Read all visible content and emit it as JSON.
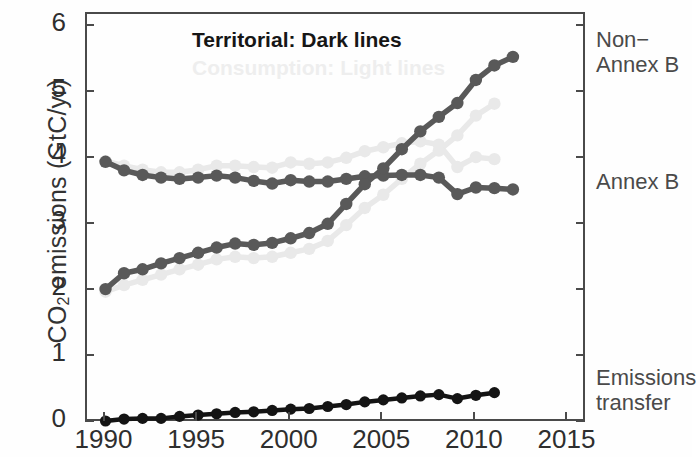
{
  "axes": {
    "ylabel_prefix": "CO",
    "ylabel_sub": "2",
    "ylabel_suffix": " emissions (GtC/yr)",
    "ytick_labels": [
      "6",
      "5",
      "4",
      "3",
      "2",
      "1",
      "0"
    ],
    "xtick_labels": [
      "1990",
      "1995",
      "2000",
      "2005",
      "2010",
      "2015"
    ]
  },
  "legend": {
    "territorial": "Territorial: Dark lines",
    "consumption": "Consumption: Light lines"
  },
  "annotations": {
    "non_annex_b": "Non−\nAnnex B",
    "annex_b": "Annex B",
    "emissions_transfer": "Emissions\ntransfer"
  },
  "colors": {
    "dark_gray": "#595959",
    "light_gray": "#e9e9e9",
    "black": "#141414",
    "frame": "#4a4a4a",
    "legend_light": "#eeeeee"
  },
  "chart_data": {
    "type": "line",
    "title": "",
    "xlabel": "",
    "ylabel": "CO2 emissions (GtC/yr)",
    "xlim": [
      1989,
      2016
    ],
    "ylim": [
      0,
      6.2
    ],
    "xticks": [
      1990,
      1995,
      2000,
      2005,
      2010,
      2015
    ],
    "yticks": [
      0,
      1,
      2,
      3,
      4,
      5,
      6
    ],
    "grid": false,
    "legend_position": "top-left",
    "x": [
      1990,
      1991,
      1992,
      1993,
      1994,
      1995,
      1996,
      1997,
      1998,
      1999,
      2000,
      2001,
      2002,
      2003,
      2004,
      2005,
      2006,
      2007,
      2008,
      2009,
      2010,
      2011,
      2012
    ],
    "series": [
      {
        "name": "Annex B territorial",
        "style": "dark",
        "color": "#595959",
        "values": [
          3.96,
          3.83,
          3.76,
          3.72,
          3.7,
          3.72,
          3.75,
          3.72,
          3.67,
          3.63,
          3.68,
          3.66,
          3.66,
          3.7,
          3.74,
          3.75,
          3.76,
          3.76,
          3.72,
          3.47,
          3.57,
          3.56,
          3.54
        ]
      },
      {
        "name": "Annex B consumption",
        "style": "light",
        "color": "#e9e9e9",
        "values": [
          3.97,
          3.9,
          3.84,
          3.8,
          3.8,
          3.84,
          3.9,
          3.9,
          3.88,
          3.87,
          3.95,
          3.93,
          3.95,
          4.02,
          4.12,
          4.18,
          4.24,
          4.27,
          4.22,
          3.88,
          4.03,
          4.0,
          null
        ]
      },
      {
        "name": "Non-Annex B territorial",
        "style": "dark",
        "color": "#595959",
        "values": [
          2.03,
          2.27,
          2.33,
          2.42,
          2.5,
          2.58,
          2.66,
          2.72,
          2.7,
          2.73,
          2.8,
          2.88,
          3.02,
          3.32,
          3.62,
          3.86,
          4.15,
          4.42,
          4.64,
          4.85,
          5.2,
          5.42,
          5.55
        ]
      },
      {
        "name": "Non-Annex B consumption",
        "style": "light",
        "color": "#e9e9e9",
        "values": [
          1.99,
          2.09,
          2.17,
          2.25,
          2.33,
          2.4,
          2.48,
          2.52,
          2.5,
          2.52,
          2.58,
          2.64,
          2.76,
          3.0,
          3.26,
          3.46,
          3.7,
          3.93,
          4.13,
          4.36,
          4.66,
          4.84,
          null
        ]
      },
      {
        "name": "Emissions transfer",
        "style": "black",
        "color": "#141414",
        "values": [
          0.03,
          0.06,
          0.07,
          0.07,
          0.1,
          0.12,
          0.14,
          0.16,
          0.17,
          0.19,
          0.21,
          0.22,
          0.25,
          0.28,
          0.32,
          0.35,
          0.38,
          0.41,
          0.43,
          0.37,
          0.42,
          0.46,
          null
        ]
      }
    ]
  }
}
